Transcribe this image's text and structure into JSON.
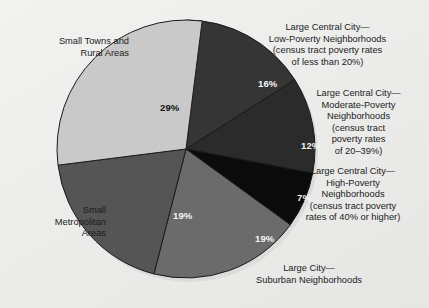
{
  "figure": {
    "background_color": "#efefee",
    "pie": {
      "center_x": 186,
      "center_y": 149,
      "radius": 129,
      "start_angle_deg": 0,
      "direction": "clockwise",
      "edge_color": "#1a1a1a",
      "shadow_color": "#d6d6d4"
    }
  },
  "labels": {
    "low_poverty": "Large Central City—\nLow-Poverty Neighborhoods\n(census tract poverty rates\nof less than 20%)",
    "moderate_poverty": "Large Central City—\nModerate-Poverty\nNeighborhoods\n(census tract\npoverty rates\nof 20–39%)",
    "high_poverty": "Large Central City—\nHigh-Poverty\nNeighborhoods\n(census tract poverty\nrates of 40% or higher)",
    "suburban": "Large City—\nSuburban Neighborhoods",
    "small_metro": "Small\nMetropolitan\nAreas",
    "small_towns": "Small Towns and\nRural Areas"
  },
  "percent_labels": {
    "low_poverty": "16%",
    "moderate_poverty": "12%",
    "high_poverty": "7%",
    "suburban": "19%",
    "small_metro": "19%",
    "small_towns": "29%"
  },
  "chart_data": {
    "type": "pie",
    "title": "",
    "subtitle": "",
    "xlabel": "",
    "ylabel": "",
    "legend_position": "callout-labels-around-pie",
    "grid": false,
    "start_angle_deg": 90,
    "direction": "clockwise",
    "units": "percent",
    "total": 102,
    "categories": [
      "Large Central City—Low-Poverty Neighborhoods (census tract poverty rates of less than 20%)",
      "Large Central City—Moderate-Poverty Neighborhoods (census tract poverty rates of 20–39%)",
      "Large Central City—High-Poverty Neighborhoods (census tract poverty rates of 40% or higher)",
      "Large City—Suburban Neighborhoods",
      "Small Metropolitan Areas",
      "Small Towns and Rural Areas"
    ],
    "values": [
      16,
      12,
      7,
      19,
      19,
      29
    ],
    "data_labels": [
      "16%",
      "12%",
      "7%",
      "19%",
      "19%",
      "29%"
    ],
    "colors": [
      "#353535",
      "#2b2b2b",
      "#0b0b0b",
      "#6b6b6b",
      "#555555",
      "#c9c9c9"
    ],
    "label_text_colors": [
      "#f4f4f4",
      "#f4f4f4",
      "#f4f4f4",
      "#f4f4f4",
      "#f4f4f4",
      "#111111"
    ],
    "slices": [
      {
        "name": "Large Central City—Low-Poverty Neighborhoods",
        "value": 16,
        "label": "16%",
        "color": "#353535",
        "start_deg": 0,
        "sweep_deg": 57.6
      },
      {
        "name": "Large Central City—Moderate-Poverty Neighborhoods",
        "value": 12,
        "label": "12%",
        "color": "#2b2b2b",
        "start_deg": 57.6,
        "sweep_deg": 43.2
      },
      {
        "name": "Large Central City—High-Poverty Neighborhoods",
        "value": 7,
        "label": "7%",
        "color": "#0b0b0b",
        "start_deg": 100.8,
        "sweep_deg": 25.2
      },
      {
        "name": "Large City—Suburban Neighborhoods",
        "value": 19,
        "label": "19%",
        "color": "#6b6b6b",
        "start_deg": 126.0,
        "sweep_deg": 68.4
      },
      {
        "name": "Small Metropolitan Areas",
        "value": 19,
        "label": "19%",
        "color": "#555555",
        "start_deg": 194.4,
        "sweep_deg": 68.4
      },
      {
        "name": "Small Towns and Rural Areas",
        "value": 29,
        "label": "29%",
        "color": "#c9c9c9",
        "start_deg": 262.8,
        "sweep_deg": 104.4
      }
    ]
  }
}
